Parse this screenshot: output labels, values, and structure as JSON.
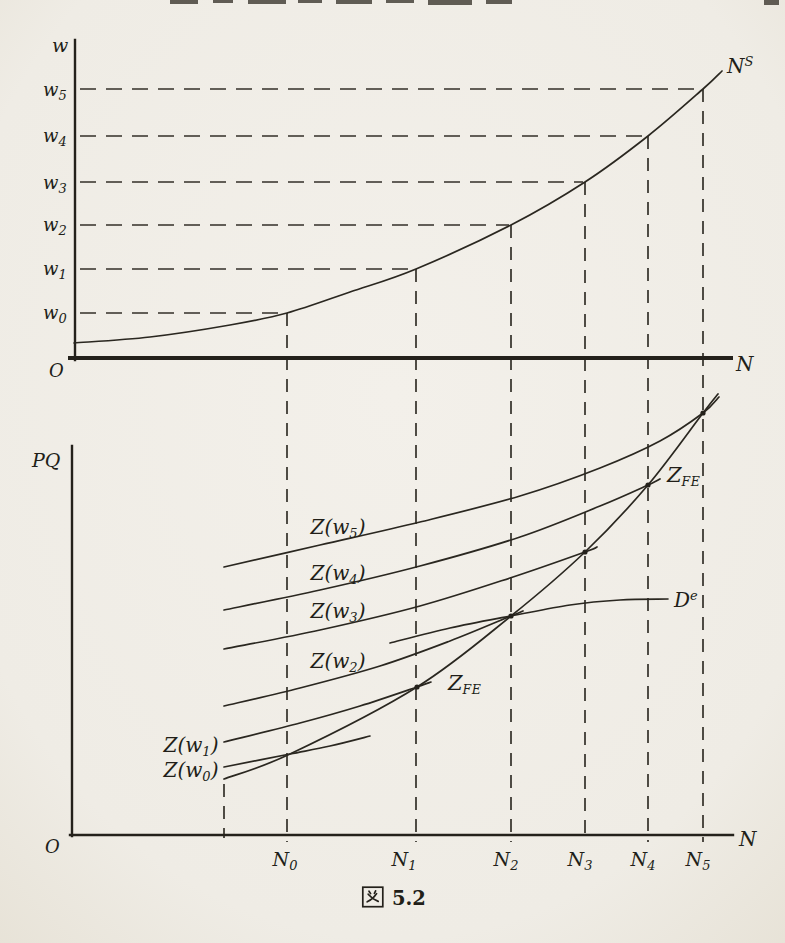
{
  "figure": {
    "paper_color": "#f2efe9",
    "ink_color": "#2a2720"
  },
  "caption": {
    "kanji": "図",
    "number": "5.2",
    "full": "図 5.2"
  },
  "chart_data": [
    {
      "id": "labor-supply-panel",
      "type": "line",
      "title": "",
      "xlabel": "N",
      "ylabel": "w",
      "origin_label": "O",
      "grid": "dashed guide lines only",
      "legend_position": "none",
      "curve": {
        "label": {
          "base": "N",
          "sup": "S"
        },
        "points": [
          [
            74,
            343
          ],
          [
            150,
            337
          ],
          [
            230,
            325
          ],
          [
            287,
            313
          ],
          [
            350,
            292
          ],
          [
            416,
            269
          ],
          [
            511,
            225
          ],
          [
            585,
            182
          ],
          [
            648,
            136
          ],
          [
            703,
            89
          ],
          [
            722,
            71
          ]
        ]
      },
      "y_tick_labels": [
        {
          "base": "w",
          "sub": "5"
        },
        {
          "base": "w",
          "sub": "4"
        },
        {
          "base": "w",
          "sub": "3"
        },
        {
          "base": "w",
          "sub": "2"
        },
        {
          "base": "w",
          "sub": "1"
        },
        {
          "base": "w",
          "sub": "0"
        }
      ],
      "wage_lines": [
        {
          "y": 89,
          "x_start": 80,
          "x_end": 700
        },
        {
          "y": 136,
          "x_start": 80,
          "x_end": 646
        },
        {
          "y": 182,
          "x_start": 80,
          "x_end": 583
        },
        {
          "y": 225,
          "x_start": 80,
          "x_end": 509
        },
        {
          "y": 269,
          "x_start": 80,
          "x_end": 414
        },
        {
          "y": 313,
          "x_start": 80,
          "x_end": 285
        }
      ],
      "employment_lines": [
        {
          "x": 287,
          "y_top": 313,
          "y_bottom": 842
        },
        {
          "x": 416,
          "y_top": 269,
          "y_bottom": 842
        },
        {
          "x": 511,
          "y_top": 225,
          "y_bottom": 842
        },
        {
          "x": 585,
          "y_top": 182,
          "y_bottom": 842
        },
        {
          "x": 648,
          "y_top": 136,
          "y_bottom": 842
        },
        {
          "x": 703,
          "y_top": 89,
          "y_bottom": 842
        }
      ]
    },
    {
      "id": "aggregate-supply-panel",
      "type": "line",
      "title": "",
      "xlabel": "N",
      "ylabel": "PQ",
      "origin_label": "O",
      "legend_position": "labels beside curves",
      "x_tick_labels": [
        {
          "base": "N",
          "sub": "0"
        },
        {
          "base": "N",
          "sub": "1"
        },
        {
          "base": "N",
          "sub": "2"
        },
        {
          "base": "N",
          "sub": "3"
        },
        {
          "base": "N",
          "sub": "4"
        },
        {
          "base": "N",
          "sub": "5"
        }
      ],
      "boundary_lines": [
        {
          "x": 224,
          "y_top": 784,
          "y_bottom": 838
        }
      ],
      "series": [
        {
          "key": "Zw5",
          "label": {
            "pre": "Z(w",
            "sub": "5",
            "post": ")"
          },
          "points": [
            [
              224,
              567
            ],
            [
              320,
              545
            ],
            [
              420,
              522
            ],
            [
              520,
              496
            ],
            [
              600,
              468
            ],
            [
              660,
              441
            ],
            [
              703,
              413
            ],
            [
              719,
              397
            ]
          ]
        },
        {
          "key": "Zw4",
          "label": {
            "pre": "Z(w",
            "sub": "4",
            "post": ")"
          },
          "points": [
            [
              224,
              610
            ],
            [
              320,
              590
            ],
            [
              420,
              566
            ],
            [
              520,
              537
            ],
            [
              600,
              506
            ],
            [
              648,
              485
            ],
            [
              660,
              479
            ]
          ]
        },
        {
          "key": "Zw3",
          "label": {
            "pre": "Z(w",
            "sub": "3",
            "post": ")"
          },
          "points": [
            [
              224,
              649
            ],
            [
              320,
              630
            ],
            [
              420,
              606
            ],
            [
              510,
              578
            ],
            [
              585,
              552
            ],
            [
              597,
              547
            ]
          ]
        },
        {
          "key": "Zw2",
          "label": {
            "pre": "Z(w",
            "sub": "2",
            "post": ")"
          },
          "points": [
            [
              224,
              706
            ],
            [
              300,
              688
            ],
            [
              380,
              666
            ],
            [
              450,
              641
            ],
            [
              511,
              616
            ],
            [
              523,
              611
            ]
          ]
        },
        {
          "key": "Zw1",
          "label": {
            "pre": "Z(w",
            "sub": "1",
            "post": ")"
          },
          "points": [
            [
              224,
              742
            ],
            [
              300,
              723
            ],
            [
              360,
              706
            ],
            [
              417,
              687
            ],
            [
              431,
              682
            ]
          ]
        },
        {
          "key": "Zw0",
          "label": {
            "pre": "Z(w",
            "sub": "0",
            "post": ")"
          },
          "points": [
            [
              224,
              767
            ],
            [
              290,
              754
            ],
            [
              330,
              746
            ],
            [
              370,
              736
            ]
          ]
        },
        {
          "key": "ZFE",
          "label": {
            "base": "Z",
            "sub": "FE"
          },
          "points": [
            [
              224,
              779
            ],
            [
              290,
              754
            ],
            [
              417,
              687
            ],
            [
              511,
              616
            ],
            [
              585,
              552
            ],
            [
              648,
              485
            ],
            [
              703,
              413
            ],
            [
              718,
              394
            ]
          ]
        },
        {
          "key": "De",
          "label": {
            "base": "D",
            "sup": "e"
          },
          "points": [
            [
              390,
              643
            ],
            [
              450,
              628
            ],
            [
              511,
              616
            ],
            [
              570,
              605
            ],
            [
              620,
              600
            ],
            [
              668,
              599
            ]
          ]
        }
      ],
      "intersections": [
        [
          417,
          687
        ],
        [
          511,
          616
        ],
        [
          585,
          552
        ],
        [
          648,
          485
        ],
        [
          703,
          413
        ]
      ]
    }
  ]
}
